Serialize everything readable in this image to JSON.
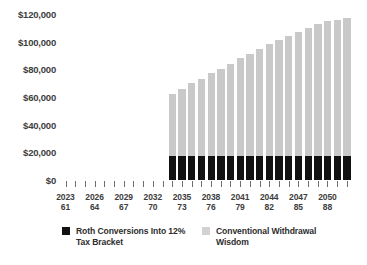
{
  "chart_data": {
    "type": "bar",
    "title": "",
    "xlabel": "",
    "ylabel": "",
    "ylim": [
      0,
      120000
    ],
    "ytick_labels": [
      "$120,000",
      "$100,000",
      "$80,000",
      "$60,000",
      "$40,000",
      "$20,000",
      "$0"
    ],
    "ytick_values": [
      120000,
      100000,
      80000,
      60000,
      40000,
      20000,
      0
    ],
    "grid": false,
    "legend_position": "bottom",
    "x_axis_rows": [
      "year",
      "age"
    ],
    "categories": [
      "2023",
      "2024",
      "2025",
      "2026",
      "2027",
      "2028",
      "2029",
      "2030",
      "2031",
      "2032",
      "2033",
      "2034",
      "2035",
      "2036",
      "2037",
      "2038",
      "2039",
      "2040",
      "2041",
      "2042",
      "2043",
      "2044",
      "2045",
      "2046",
      "2047",
      "2048",
      "2049",
      "2050",
      "2051",
      "2052"
    ],
    "ages": [
      "61",
      "62",
      "63",
      "64",
      "65",
      "66",
      "67",
      "68",
      "69",
      "70",
      "71",
      "72",
      "73",
      "74",
      "75",
      "76",
      "77",
      "78",
      "79",
      "80",
      "81",
      "82",
      "83",
      "84",
      "85",
      "86",
      "87",
      "88",
      "89",
      "90"
    ],
    "tick_labels": [
      {
        "year": "2023",
        "age": "61",
        "index": 0
      },
      {
        "year": "2026",
        "age": "64",
        "index": 3
      },
      {
        "year": "2029",
        "age": "67",
        "index": 6
      },
      {
        "year": "2032",
        "age": "70",
        "index": 9
      },
      {
        "year": "2035",
        "age": "73",
        "index": 12
      },
      {
        "year": "2038",
        "age": "76",
        "index": 15
      },
      {
        "year": "2041",
        "age": "79",
        "index": 18
      },
      {
        "year": "2044",
        "age": "82",
        "index": 21
      },
      {
        "year": "2047",
        "age": "85",
        "index": 24
      },
      {
        "year": "2050",
        "age": "88",
        "index": 27
      }
    ],
    "series": [
      {
        "name": "Roth Conversions Into 12% Tax Bracket",
        "color": "#121212",
        "values": [
          0,
          0,
          0,
          0,
          0,
          0,
          0,
          0,
          0,
          0,
          0,
          17500,
          17500,
          17500,
          17500,
          17500,
          17500,
          17500,
          17500,
          17500,
          17500,
          17500,
          17500,
          17500,
          17500,
          17500,
          17500,
          17500,
          17500,
          17500
        ]
      },
      {
        "name": "Conventional Withdrawal Wisdom",
        "color": "#c9c9c9",
        "values": [
          0,
          0,
          0,
          0,
          0,
          0,
          0,
          0,
          0,
          0,
          0,
          62000,
          66000,
          70000,
          73000,
          77000,
          80000,
          84000,
          88000,
          91000,
          95000,
          98000,
          101000,
          104000,
          107000,
          110000,
          113000,
          115000,
          116000,
          117000
        ]
      }
    ],
    "legend": [
      {
        "label": "Roth Conversions Into 12% Tax Bracket",
        "color": "#121212"
      },
      {
        "label": "Conventional Withdrawal Wisdom",
        "color": "#d2d2d2"
      }
    ]
  }
}
